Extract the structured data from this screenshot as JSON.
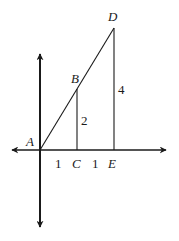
{
  "diagram": {
    "points": {
      "A": {
        "label": "A",
        "x": 40,
        "y": 150
      },
      "B": {
        "label": "B",
        "x": 77,
        "y": 89
      },
      "C": {
        "label": "C",
        "x": 77,
        "y": 150
      },
      "D": {
        "label": "D",
        "x": 114,
        "y": 28
      },
      "E": {
        "label": "E",
        "x": 114,
        "y": 150
      }
    },
    "segment_labels": {
      "BC": "2",
      "DE": "4",
      "AC": "1",
      "CE": "1"
    },
    "colors": {
      "stroke": "#1a1a1a",
      "background": "#ffffff"
    }
  }
}
